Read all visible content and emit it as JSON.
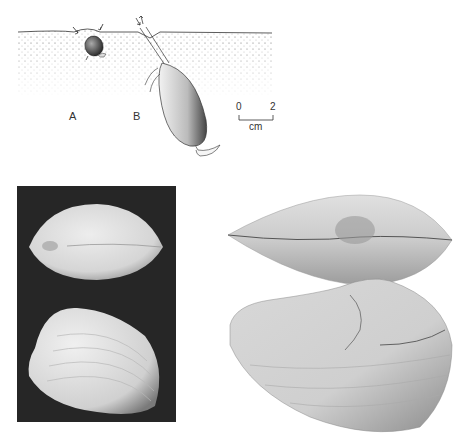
{
  "figure": {
    "panel_labels": {
      "a": "A",
      "b": "B"
    },
    "scale_bar": {
      "start": "0",
      "end": "2",
      "unit": "cm"
    },
    "colors": {
      "background": "#ffffff",
      "ink": "#333333",
      "photo_background": "#262626",
      "shell_light": "#e4e4e4",
      "fossil_shell": "#c8c8c8"
    },
    "subjects": {
      "drawing_a": "shell-in-sediment-shallow",
      "drawing_b": "burrowing-clam-with-siphon",
      "photo_left_top": "clam-shell-dorsal-view",
      "photo_left_bottom": "clam-shell-lateral-view",
      "photo_right_top": "fossil-shell-dorsal-view",
      "photo_right_bottom": "fossil-shell-lateral-view"
    }
  }
}
